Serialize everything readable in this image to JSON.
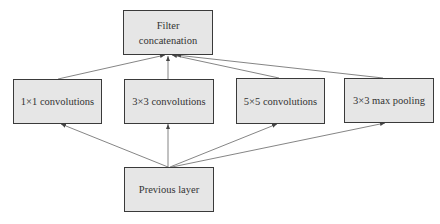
{
  "diagram": {
    "nodes": [
      {
        "id": "concat",
        "label_line1": "Filter",
        "label_line2": "concatenation"
      },
      {
        "id": "conv1x1",
        "label": "1×1 convolutions"
      },
      {
        "id": "conv3x3",
        "label": "3×3 convolutions"
      },
      {
        "id": "conv5x5",
        "label": "5×5 convolutions"
      },
      {
        "id": "pool3x3",
        "label": "3×3 max pooling"
      },
      {
        "id": "prev",
        "label": "Previous layer"
      }
    ],
    "edges": [
      {
        "from": "prev",
        "to": "conv1x1"
      },
      {
        "from": "prev",
        "to": "conv3x3"
      },
      {
        "from": "prev",
        "to": "conv5x5"
      },
      {
        "from": "prev",
        "to": "pool3x3"
      },
      {
        "from": "conv1x1",
        "to": "concat"
      },
      {
        "from": "conv3x3",
        "to": "concat"
      },
      {
        "from": "conv5x5",
        "to": "concat"
      },
      {
        "from": "pool3x3",
        "to": "concat"
      }
    ],
    "colors": {
      "node_fill": "#e6e6e6",
      "node_border": "#3a3a3a",
      "edge": "#555555"
    }
  }
}
